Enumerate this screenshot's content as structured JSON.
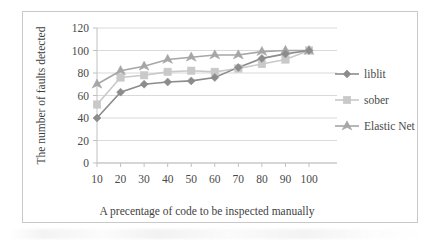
{
  "chart_data": {
    "type": "line",
    "title": "",
    "xlabel": "A precentage of code to be inspected manually",
    "ylabel": "The number of faults detected",
    "categories": [
      "10",
      "20",
      "30",
      "40",
      "50",
      "60",
      "70",
      "80",
      "90",
      "100"
    ],
    "x": [
      10,
      20,
      30,
      40,
      50,
      60,
      70,
      80,
      90,
      100
    ],
    "xlim": [
      10,
      100
    ],
    "ylim": [
      0,
      120
    ],
    "yticks": [
      0,
      20,
      40,
      60,
      80,
      100,
      120
    ],
    "ytick_labels": [
      "0",
      "20",
      "40",
      "60",
      "80",
      "100",
      "120"
    ],
    "xtick_labels": [
      "10",
      "20",
      "30",
      "40",
      "50",
      "60",
      "70",
      "80",
      "90",
      "100"
    ],
    "grid": "horizontal",
    "legend_position": "right",
    "series": [
      {
        "name": "liblit",
        "marker": "diamond",
        "color": "#8c8c8c",
        "values": [
          40,
          63,
          70,
          72,
          73,
          76,
          85,
          93,
          97,
          100
        ]
      },
      {
        "name": "sober",
        "marker": "square",
        "color": "#c9c9c9",
        "values": [
          52,
          76,
          78,
          81,
          82,
          81,
          84,
          88,
          92,
          100
        ]
      },
      {
        "name": "Elastic Net",
        "marker": "triangle",
        "color": "#a6a6a6",
        "values": [
          70,
          82,
          86,
          92,
          94,
          96,
          96,
          99,
          100,
          100
        ]
      }
    ]
  },
  "legend": {
    "items": [
      {
        "label": "liblit"
      },
      {
        "label": "sober"
      },
      {
        "label": "Elastic Net"
      }
    ]
  },
  "axes": {
    "y_title": "The number of faults detected",
    "x_title": "A precentage of code to be inspected manually"
  },
  "colors": {
    "liblit": "#8c8c8c",
    "sober": "#c9c9c9",
    "elastic_net": "#a6a6a6",
    "gridline": "#d9d9d9",
    "border": "#c9c9c9",
    "text": "#4a4a4a"
  }
}
